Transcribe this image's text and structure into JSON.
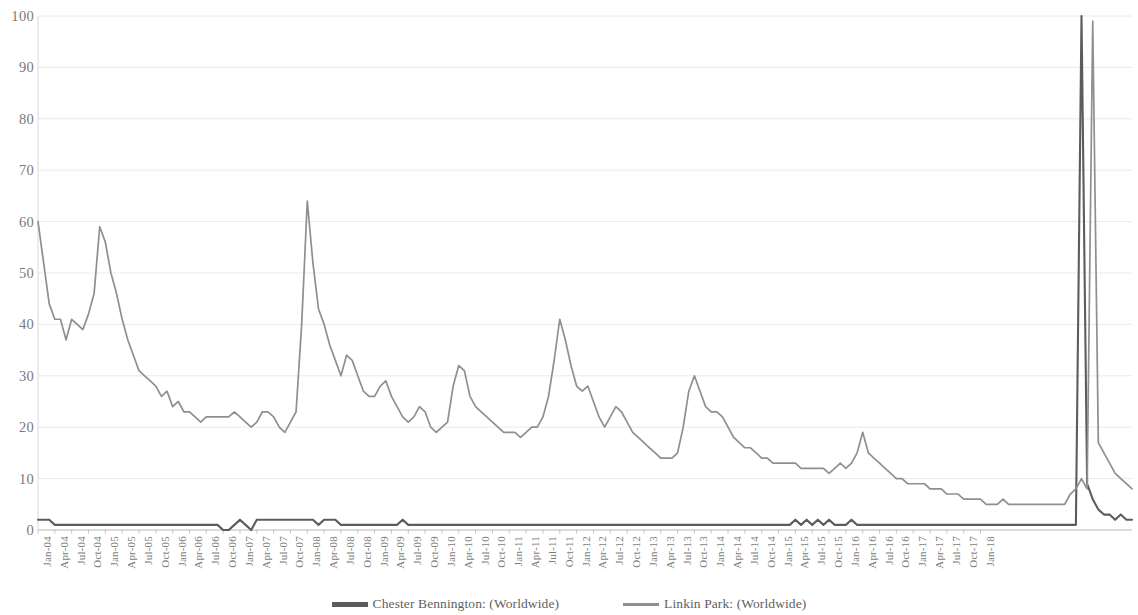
{
  "chart_data": {
    "type": "line",
    "title": "",
    "subtitle": "",
    "xlabel": "",
    "ylabel": "",
    "ylim": [
      0,
      100
    ],
    "y_ticks": [
      0,
      10,
      20,
      30,
      40,
      50,
      60,
      70,
      80,
      90,
      100
    ],
    "grid": true,
    "legend_position": "bottom",
    "x_tick_labels": [
      "Jan-04",
      "Apr-04",
      "Jul-04",
      "Oct-04",
      "Jan-05",
      "Apr-05",
      "Jul-05",
      "Oct-05",
      "Jan-06",
      "Apr-06",
      "Jul-06",
      "Oct-06",
      "Jan-07",
      "Apr-07",
      "Jul-07",
      "Oct-07",
      "Jan-08",
      "Apr-08",
      "Jul-08",
      "Oct-08",
      "Jan-09",
      "Apr-09",
      "Jul-09",
      "Oct-09",
      "Jan-10",
      "Apr-10",
      "Jul-10",
      "Oct-10",
      "Jan-11",
      "Apr-11",
      "Jul-11",
      "Oct-11",
      "Jan-12",
      "Apr-12",
      "Jul-12",
      "Oct-12",
      "Jan-13",
      "Apr-13",
      "Jul-13",
      "Oct-13",
      "Jan-14",
      "Apr-14",
      "Jul-14",
      "Oct-14",
      "Jan-15",
      "Apr-15",
      "Jul-15",
      "Oct-15",
      "Jan-16",
      "Apr-16",
      "Jul-16",
      "Oct-16",
      "Jan-17",
      "Apr-17",
      "Jul-17",
      "Oct-17",
      "Jan-18"
    ],
    "x_start": "Jan-04",
    "x_end": "Jan-18",
    "x_frequency": "monthly",
    "series": [
      {
        "name": "Chester Bennington: (Worldwide)",
        "color": "#5c5c5c",
        "values": [
          2,
          2,
          2,
          1,
          1,
          1,
          1,
          1,
          1,
          1,
          1,
          1,
          1,
          1,
          1,
          1,
          1,
          1,
          1,
          1,
          1,
          1,
          1,
          1,
          1,
          1,
          1,
          1,
          1,
          1,
          1,
          1,
          1,
          0,
          0,
          1,
          2,
          1,
          0,
          2,
          2,
          2,
          2,
          2,
          2,
          2,
          2,
          2,
          2,
          2,
          1,
          2,
          2,
          2,
          1,
          1,
          1,
          1,
          1,
          1,
          1,
          1,
          1,
          1,
          1,
          2,
          1,
          1,
          1,
          1,
          1,
          1,
          1,
          1,
          1,
          1,
          1,
          1,
          1,
          1,
          1,
          1,
          1,
          1,
          1,
          1,
          1,
          1,
          1,
          1,
          1,
          1,
          1,
          1,
          1,
          1,
          1,
          1,
          1,
          1,
          1,
          1,
          1,
          1,
          1,
          1,
          1,
          1,
          1,
          1,
          1,
          1,
          1,
          1,
          1,
          1,
          1,
          1,
          1,
          1,
          1,
          1,
          1,
          1,
          1,
          1,
          1,
          1,
          1,
          1,
          1,
          1,
          1,
          1,
          1,
          2,
          1,
          2,
          1,
          2,
          1,
          2,
          1,
          1,
          1,
          2,
          1,
          1,
          1,
          1,
          1,
          1,
          1,
          1,
          1,
          1,
          1,
          1,
          1,
          1,
          1,
          1,
          1,
          1,
          1,
          1,
          1,
          1,
          1,
          1,
          1,
          1,
          1,
          1,
          1,
          1,
          1,
          1,
          1,
          1,
          1,
          1,
          1,
          1,
          1,
          1,
          100,
          9,
          6,
          4,
          3,
          3,
          2,
          3,
          2,
          2
        ]
      },
      {
        "name": "Linkin Park: (Worldwide)",
        "color": "#8f8f8f",
        "values": [
          60,
          52,
          44,
          41,
          41,
          37,
          41,
          40,
          39,
          42,
          46,
          59,
          56,
          50,
          46,
          41,
          37,
          34,
          31,
          30,
          29,
          28,
          26,
          27,
          24,
          25,
          23,
          23,
          22,
          21,
          22,
          22,
          22,
          22,
          22,
          23,
          22,
          21,
          20,
          21,
          23,
          23,
          22,
          20,
          19,
          21,
          23,
          40,
          64,
          52,
          43,
          40,
          36,
          33,
          30,
          34,
          33,
          30,
          27,
          26,
          26,
          28,
          29,
          26,
          24,
          22,
          21,
          22,
          24,
          23,
          20,
          19,
          20,
          21,
          28,
          32,
          31,
          26,
          24,
          23,
          22,
          21,
          20,
          19,
          19,
          19,
          18,
          19,
          20,
          20,
          22,
          26,
          33,
          41,
          37,
          32,
          28,
          27,
          28,
          25,
          22,
          20,
          22,
          24,
          23,
          21,
          19,
          18,
          17,
          16,
          15,
          14,
          14,
          14,
          15,
          20,
          27,
          30,
          27,
          24,
          23,
          23,
          22,
          20,
          18,
          17,
          16,
          16,
          15,
          14,
          14,
          13,
          13,
          13,
          13,
          13,
          12,
          12,
          12,
          12,
          12,
          11,
          12,
          13,
          12,
          13,
          15,
          19,
          15,
          14,
          13,
          12,
          11,
          10,
          10,
          9,
          9,
          9,
          9,
          8,
          8,
          8,
          7,
          7,
          7,
          6,
          6,
          6,
          6,
          5,
          5,
          5,
          6,
          5,
          5,
          5,
          5,
          5,
          5,
          5,
          5,
          5,
          5,
          5,
          7,
          8,
          10,
          8,
          99,
          17,
          15,
          13,
          11,
          10,
          9,
          8
        ]
      }
    ]
  },
  "legend": {
    "items": [
      {
        "label": "Chester Bennington: (Worldwide)",
        "color": "#5c5c5c"
      },
      {
        "label": "Linkin Park: (Worldwide)",
        "color": "#8f8f8f"
      }
    ]
  },
  "axes": {
    "y_max_label": "100",
    "y_min_label": "0"
  }
}
